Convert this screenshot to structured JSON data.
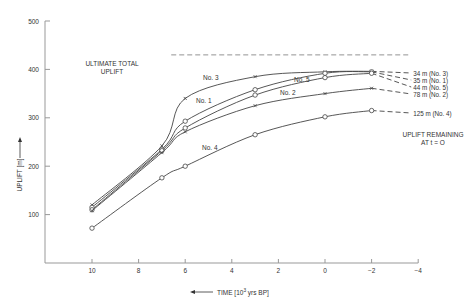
{
  "chart_data": {
    "type": "line",
    "title": "",
    "xlabel": "TIME [10^3 yrs BP]",
    "xlabel_parts": {
      "arrow": "←",
      "pre": "TIME [10",
      "sup": "3",
      "post": " yrs BP]"
    },
    "ylabel": "UPLIFT [m]",
    "xlim": [
      11.5,
      -4
    ],
    "ylim": [
      0,
      500
    ],
    "x_ticks": [
      10,
      8,
      6,
      4,
      2,
      0,
      -2,
      -4
    ],
    "x_tick_labels": [
      "10",
      "8",
      "6",
      "4",
      "2",
      "0",
      "−2",
      "−4"
    ],
    "y_ticks": [
      100,
      200,
      300,
      400,
      500
    ],
    "y_tick_labels": [
      "100",
      "200",
      "300",
      "400",
      "500"
    ],
    "grid": false,
    "ultimate_total_uplift": {
      "label_line1": "ULTIMATE TOTAL",
      "label_line2": "UPLIFT",
      "value": 430,
      "x_from": 6.6,
      "x_to": -3.7
    },
    "remaining_annotation": {
      "line1": "UPLIFT REMAINING",
      "line2": "AT t = O"
    },
    "series": [
      {
        "name": "No. 3",
        "marker": "x",
        "x": [
          10,
          7,
          6,
          3,
          0,
          -2
        ],
        "values": [
          120,
          242,
          340,
          385,
          395,
          396
        ],
        "extrapolated_to": -3.7,
        "end_label": "34 m (No. 3)",
        "label_pos": [
          203,
          80
        ]
      },
      {
        "name": "No. 1",
        "marker": "o",
        "x": [
          10,
          7,
          6,
          3,
          0,
          -2
        ],
        "values": [
          115,
          235,
          293,
          358,
          392,
          395
        ],
        "extrapolated_to": -3.7,
        "end_label": "35 m (No. 1)",
        "label_pos": [
          196,
          103
        ]
      },
      {
        "name": "No. 5",
        "marker": "o",
        "x": [
          10,
          7,
          6,
          3,
          0,
          -2
        ],
        "values": [
          110,
          232,
          279,
          347,
          383,
          392
        ],
        "extrapolated_to": -3.7,
        "end_label": "44 m (No. 5)",
        "label_pos": [
          294,
          82
        ]
      },
      {
        "name": "No. 2",
        "marker": "x",
        "x": [
          10,
          7,
          6,
          3,
          0,
          -2
        ],
        "values": [
          108,
          228,
          271,
          325,
          350,
          361
        ],
        "extrapolated_to": -3.7,
        "end_label": "78 m (No. 2)",
        "label_pos": [
          280,
          95
        ]
      },
      {
        "name": "No. 4",
        "marker": "o",
        "x": [
          10,
          7,
          6,
          3,
          0,
          -2
        ],
        "values": [
          72,
          176,
          200,
          265,
          302,
          315
        ],
        "extrapolated_to": -3.7,
        "end_label": "125 m (No. 4)",
        "label_pos": [
          202,
          150
        ]
      }
    ],
    "legend": "none (inline curve labels)"
  }
}
